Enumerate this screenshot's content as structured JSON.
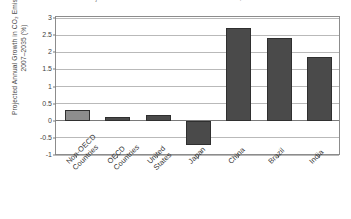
{
  "figure": {
    "caption": "Table 2. Projected Sources of Growth in CO2 Emissions, 2007-2035"
  },
  "chart_data": {
    "type": "bar",
    "title": "Table 2. Projected Sources of Growth in CO2 Emissions, 2007-2035",
    "xlabel": "",
    "ylabel": "Projected Annual Growth in CO₂ Emissions, 2007–2035 (%)",
    "categories": [
      "Non-OECD Countries",
      "OECD Countries",
      "United States",
      "Japan",
      "China",
      "Brazil",
      "India"
    ],
    "values": [
      0.3,
      0.1,
      0.17,
      -0.7,
      2.72,
      2.43,
      1.85
    ],
    "ylim": [
      -1,
      3
    ],
    "yticks": [
      3,
      2.5,
      2,
      1.5,
      1,
      0.5,
      0,
      -0.5,
      -1
    ],
    "ytick_labels": [
      "3",
      "2.5",
      "2",
      "1.5",
      "1",
      "0.5",
      "0",
      "-0.5",
      "-1"
    ],
    "grid": true,
    "legend": false,
    "bar_colors": [
      "#8d8d8d",
      "#4a4a4a",
      "#4a4a4a",
      "#4a4a4a",
      "#4a4a4a",
      "#4a4a4a",
      "#4a4a4a"
    ],
    "bar_border_color": "#2f2f2f",
    "gridline_color": "#b9b9b9",
    "zeroline_color": "#7a7a7a",
    "axis_color": "#8c8c8c",
    "background": "#ffffff"
  }
}
